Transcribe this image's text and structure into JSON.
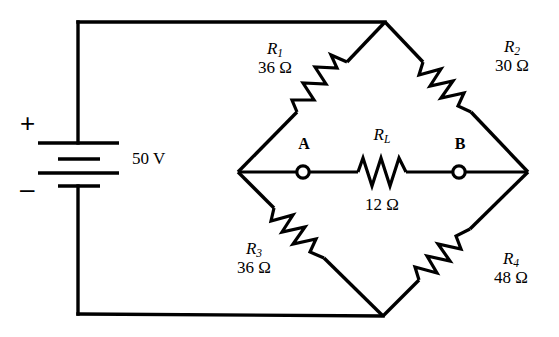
{
  "diagram": {
    "stroke_color": "#000000",
    "background_color": "#ffffff"
  },
  "source": {
    "name": "battery",
    "value": "50 V",
    "plus_sign": "+",
    "minus_sign": "–"
  },
  "nodes": [
    {
      "id": "A",
      "label": "A"
    },
    {
      "id": "B",
      "label": "B"
    }
  ],
  "resistors": [
    {
      "id": "R1",
      "symbol": "R",
      "subscript": "1",
      "value": "36 Ω",
      "arm": "upper-left"
    },
    {
      "id": "R2",
      "symbol": "R",
      "subscript": "2",
      "value": "30 Ω",
      "arm": "upper-right"
    },
    {
      "id": "R3",
      "symbol": "R",
      "subscript": "3",
      "value": "36 Ω",
      "arm": "lower-left"
    },
    {
      "id": "R4",
      "symbol": "R",
      "subscript": "4",
      "value": "48 Ω",
      "arm": "lower-right"
    },
    {
      "id": "RL",
      "symbol": "R",
      "subscript": "L",
      "value": "12 Ω",
      "arm": "bridge"
    }
  ]
}
